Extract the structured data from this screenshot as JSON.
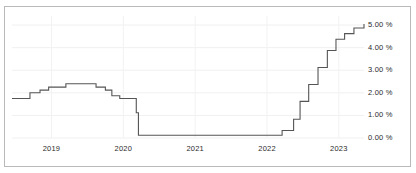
{
  "chart_data": {
    "type": "line",
    "title": "",
    "xlabel": "",
    "ylabel": "",
    "ylim": [
      0.0,
      5.4
    ],
    "xlim": [
      2018.45,
      2023.35
    ],
    "grid": true,
    "legend": null,
    "line_style": "step-post",
    "line_color": "#555555",
    "y_ticks": [
      0.0,
      1.0,
      2.0,
      3.0,
      4.0,
      5.0
    ],
    "y_tick_labels": [
      "0.00 %",
      "1.00 %",
      "2.00 %",
      "3.00 %",
      "4.00 %",
      "5.00 %"
    ],
    "y_tick_side": "right",
    "x_ticks": [
      2019,
      2020,
      2021,
      2022,
      2023
    ],
    "x_tick_labels": [
      "2019",
      "2020",
      "2021",
      "2022",
      "2023"
    ],
    "x": [
      2018.45,
      2018.7,
      2018.84,
      2018.96,
      2019.2,
      2019.58,
      2019.62,
      2019.75,
      2019.84,
      2019.95,
      2020.13,
      2020.18,
      2020.21,
      2021.0,
      2021.5,
      2022.0,
      2022.21,
      2022.37,
      2022.46,
      2022.58,
      2022.71,
      2022.84,
      2022.96,
      2023.08,
      2023.21,
      2023.35
    ],
    "values": [
      1.75,
      2.0,
      2.12,
      2.25,
      2.4,
      2.4,
      2.25,
      2.12,
      1.87,
      1.75,
      1.75,
      1.12,
      0.12,
      0.12,
      0.12,
      0.12,
      0.33,
      0.83,
      1.62,
      2.37,
      3.12,
      3.87,
      4.37,
      4.62,
      4.87,
      5.05
    ]
  },
  "axis": {
    "y_labels": [
      "5.00 %",
      "4.00 %",
      "3.00 %",
      "2.00 %",
      "1.00 %",
      "0.00 %"
    ],
    "x_labels": [
      "2019",
      "2020",
      "2021",
      "2022",
      "2023"
    ]
  }
}
